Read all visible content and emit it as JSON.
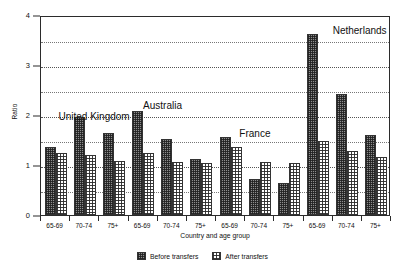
{
  "chart_data": {
    "type": "bar",
    "title": "",
    "xlabel": "Country and age group",
    "ylabel": "Ratio",
    "ylim": [
      0,
      4
    ],
    "yticks": [
      0,
      1,
      2,
      3,
      4
    ],
    "ytick_labels": [
      "0",
      "1",
      "2",
      "3",
      "4"
    ],
    "gridlines": [
      0.5,
      1,
      1.5,
      2,
      2.5,
      3,
      3.5
    ],
    "grid": true,
    "legend_position": "below",
    "categories": [
      "65-69",
      "70-74",
      "75+",
      "65-69",
      "70-74",
      "75+",
      "65-69",
      "70-74",
      "75+",
      "65-69",
      "70-74",
      "75+"
    ],
    "groups": [
      {
        "label": "United Kingdom",
        "categories": [
          "65-69",
          "70-74",
          "75+"
        ]
      },
      {
        "label": "Australia",
        "categories": [
          "65-69",
          "70-74",
          "75+"
        ]
      },
      {
        "label": "France",
        "categories": [
          "65-69",
          "70-74",
          "75+"
        ]
      },
      {
        "label": "Netherlands",
        "categories": [
          "65-69",
          "70-74",
          "75+"
        ]
      }
    ],
    "series": [
      {
        "name": "Before transfers",
        "color": "#8d8d8d",
        "values": [
          1.37,
          1.97,
          1.64,
          2.08,
          1.52,
          1.12,
          1.57,
          0.72,
          0.64,
          3.63,
          2.42,
          1.6
        ]
      },
      {
        "name": "After transfers",
        "color": "#ffffff",
        "values": [
          1.25,
          1.21,
          1.09,
          1.24,
          1.06,
          1.05,
          1.37,
          1.07,
          1.05,
          1.49,
          1.28,
          1.17
        ]
      }
    ],
    "annotations": [
      {
        "text": "United Kingdom",
        "x": 0.6,
        "y": 2.12
      },
      {
        "text": "Australia",
        "x": 3.5,
        "y": 2.35
      },
      {
        "text": "France",
        "x": 6.8,
        "y": 1.78
      },
      {
        "text": "Netherlands",
        "x": 10.0,
        "y": 3.85
      }
    ]
  },
  "legend": {
    "entries": [
      {
        "label": "Before transfers",
        "pattern": "dense-hatch-dark"
      },
      {
        "label": "After transfers",
        "pattern": "checkerboard-light"
      }
    ]
  }
}
